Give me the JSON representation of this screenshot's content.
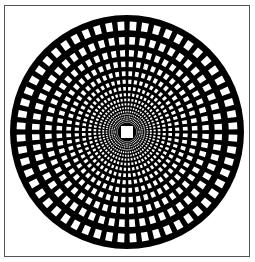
{
  "figure": {
    "kind": "polar grid op-art pattern",
    "background_color": "#ffffff",
    "frame_color": "#555555",
    "disk_color": "#000000",
    "cell_color": "#ffffff",
    "center": [
      127,
      132
    ],
    "radius": 117,
    "rings": 17,
    "sectors": 56,
    "center_square_size": 12
  }
}
